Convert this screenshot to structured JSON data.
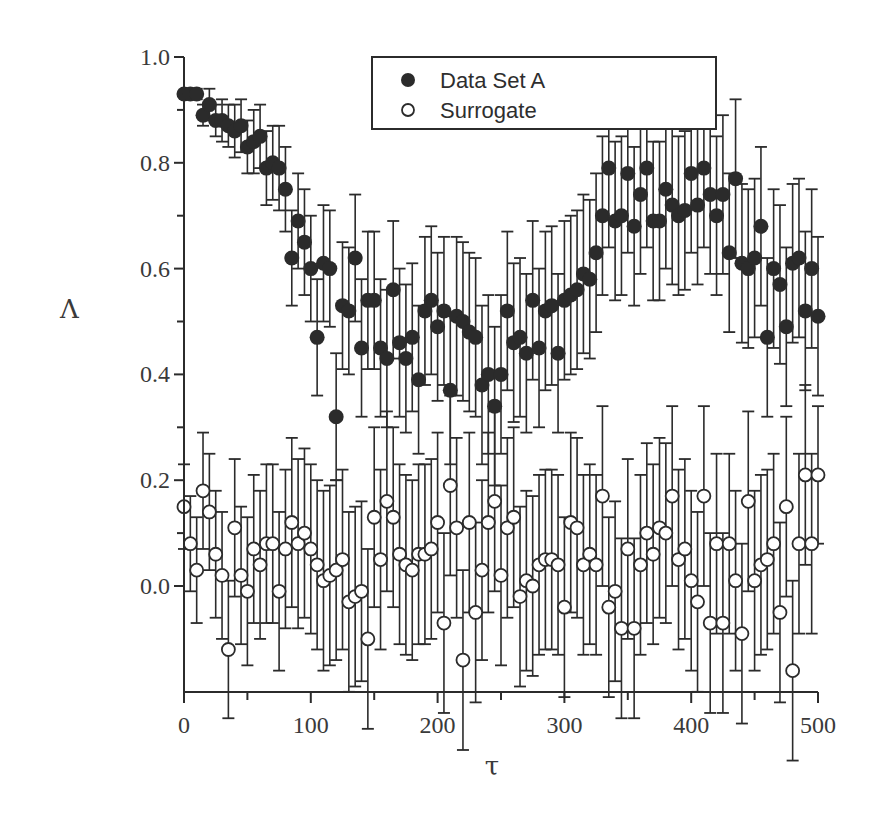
{
  "chart_data": {
    "type": "scatter",
    "title": "",
    "xlabel": "τ",
    "ylabel": "Λ",
    "xlim": [
      0,
      500
    ],
    "ylim": [
      -0.2,
      1.0
    ],
    "x_ticks": [
      0,
      100,
      200,
      300,
      400,
      500
    ],
    "x_tick_labels": [
      "0",
      "100",
      "200",
      "300",
      "400",
      "500"
    ],
    "y_ticks": [
      0.0,
      0.2,
      0.4,
      0.6,
      0.8,
      1.0
    ],
    "y_tick_labels": [
      "0.0",
      "0.2",
      "0.4",
      "0.6",
      "0.8",
      "1.0"
    ],
    "grid": false,
    "error_bars": true,
    "legend": {
      "position": "upper center",
      "entries": [
        "Data Set A",
        "Surrogate"
      ]
    },
    "x": [
      0,
      5,
      10,
      15,
      20,
      25,
      30,
      35,
      40,
      45,
      50,
      55,
      60,
      65,
      70,
      75,
      80,
      85,
      90,
      95,
      100,
      105,
      110,
      115,
      120,
      125,
      130,
      135,
      140,
      145,
      150,
      155,
      160,
      165,
      170,
      175,
      180,
      185,
      190,
      195,
      200,
      205,
      210,
      215,
      220,
      225,
      230,
      235,
      240,
      245,
      250,
      255,
      260,
      265,
      270,
      275,
      280,
      285,
      290,
      295,
      300,
      305,
      310,
      315,
      320,
      325,
      330,
      335,
      340,
      345,
      350,
      355,
      360,
      365,
      370,
      375,
      380,
      385,
      390,
      395,
      400,
      405,
      410,
      415,
      420,
      425,
      430,
      435,
      440,
      445,
      450,
      455,
      460,
      465,
      470,
      475,
      480,
      485,
      490,
      495,
      500
    ],
    "series": [
      {
        "name": "Data Set A",
        "marker": "filled-circle",
        "values": [
          0.93,
          0.93,
          0.93,
          0.89,
          0.91,
          0.88,
          0.88,
          0.87,
          0.86,
          0.87,
          0.83,
          0.84,
          0.85,
          0.79,
          0.8,
          0.79,
          0.75,
          0.62,
          0.69,
          0.65,
          0.6,
          0.47,
          0.61,
          0.6,
          0.32,
          0.53,
          0.52,
          0.62,
          0.45,
          0.54,
          0.54,
          0.45,
          0.43,
          0.56,
          0.46,
          0.43,
          0.47,
          0.39,
          0.52,
          0.54,
          0.49,
          0.52,
          0.37,
          0.51,
          0.5,
          0.48,
          0.47,
          0.38,
          0.4,
          0.34,
          0.4,
          0.52,
          0.46,
          0.47,
          0.44,
          0.54,
          0.45,
          0.52,
          0.53,
          0.44,
          0.54,
          0.55,
          0.56,
          0.59,
          0.58,
          0.63,
          0.7,
          0.79,
          0.69,
          0.7,
          0.78,
          0.68,
          0.74,
          0.79,
          0.69,
          0.69,
          0.75,
          0.72,
          0.7,
          0.71,
          0.78,
          0.72,
          0.79,
          0.74,
          0.7,
          0.74,
          0.63,
          0.77,
          0.61,
          0.6,
          0.62,
          0.68,
          0.47,
          0.6,
          0.57,
          0.49,
          0.61,
          0.62,
          0.52,
          0.6,
          0.51
        ],
        "errors": [
          0.0,
          0.0,
          0.01,
          0.02,
          0.03,
          0.03,
          0.04,
          0.04,
          0.05,
          0.05,
          0.05,
          0.06,
          0.06,
          0.07,
          0.07,
          0.08,
          0.08,
          0.09,
          0.09,
          0.1,
          0.1,
          0.11,
          0.11,
          0.11,
          0.12,
          0.12,
          0.12,
          0.12,
          0.13,
          0.13,
          0.13,
          0.13,
          0.13,
          0.13,
          0.14,
          0.14,
          0.14,
          0.14,
          0.14,
          0.14,
          0.14,
          0.14,
          0.14,
          0.15,
          0.15,
          0.15,
          0.15,
          0.15,
          0.15,
          0.15,
          0.15,
          0.15,
          0.15,
          0.15,
          0.15,
          0.15,
          0.15,
          0.15,
          0.15,
          0.15,
          0.15,
          0.15,
          0.15,
          0.15,
          0.15,
          0.15,
          0.15,
          0.15,
          0.15,
          0.15,
          0.15,
          0.15,
          0.15,
          0.15,
          0.15,
          0.15,
          0.15,
          0.15,
          0.15,
          0.15,
          0.15,
          0.15,
          0.15,
          0.15,
          0.15,
          0.15,
          0.15,
          0.15,
          0.15,
          0.15,
          0.15,
          0.15,
          0.15,
          0.15,
          0.15,
          0.15,
          0.15,
          0.15,
          0.15,
          0.15,
          0.15
        ]
      },
      {
        "name": "Surrogate",
        "marker": "open-circle",
        "values": [
          0.15,
          0.08,
          0.03,
          0.18,
          0.14,
          0.06,
          0.02,
          -0.12,
          0.11,
          0.02,
          -0.01,
          0.07,
          0.04,
          0.08,
          0.08,
          -0.01,
          0.07,
          0.12,
          0.08,
          0.1,
          0.07,
          0.04,
          0.01,
          0.02,
          0.03,
          0.05,
          -0.03,
          -0.02,
          -0.01,
          -0.1,
          0.13,
          0.05,
          0.16,
          0.13,
          0.06,
          0.04,
          0.03,
          0.06,
          0.06,
          0.07,
          0.12,
          -0.07,
          0.19,
          0.11,
          -0.14,
          0.12,
          -0.05,
          0.03,
          0.12,
          0.16,
          0.02,
          0.11,
          0.13,
          -0.02,
          0.01,
          0.0,
          0.04,
          0.05,
          0.05,
          0.04,
          -0.04,
          0.12,
          0.11,
          0.04,
          0.06,
          0.04,
          0.17,
          -0.04,
          -0.01,
          -0.08,
          0.07,
          -0.08,
          0.04,
          0.1,
          0.06,
          0.11,
          0.1,
          0.17,
          0.05,
          0.07,
          0.01,
          -0.03,
          0.17,
          -0.07,
          0.08,
          -0.07,
          0.08,
          0.01,
          -0.09,
          0.16,
          0.01,
          0.04,
          0.05,
          0.08,
          -0.05,
          0.15,
          -0.16,
          0.08,
          0.21,
          0.08,
          0.21
        ],
        "errors": [
          0.08,
          0.09,
          0.1,
          0.11,
          0.11,
          0.12,
          0.12,
          0.13,
          0.13,
          0.13,
          0.14,
          0.14,
          0.14,
          0.15,
          0.15,
          0.15,
          0.15,
          0.16,
          0.16,
          0.16,
          0.16,
          0.16,
          0.17,
          0.17,
          0.17,
          0.17,
          0.17,
          0.17,
          0.17,
          0.17,
          0.17,
          0.17,
          0.17,
          0.17,
          0.17,
          0.17,
          0.17,
          0.17,
          0.17,
          0.17,
          0.17,
          0.17,
          0.17,
          0.17,
          0.17,
          0.17,
          0.17,
          0.17,
          0.17,
          0.17,
          0.17,
          0.17,
          0.17,
          0.17,
          0.17,
          0.17,
          0.17,
          0.17,
          0.17,
          0.17,
          0.17,
          0.17,
          0.17,
          0.17,
          0.17,
          0.17,
          0.17,
          0.17,
          0.17,
          0.17,
          0.17,
          0.17,
          0.17,
          0.17,
          0.17,
          0.17,
          0.17,
          0.17,
          0.17,
          0.17,
          0.17,
          0.17,
          0.17,
          0.17,
          0.17,
          0.17,
          0.17,
          0.17,
          0.17,
          0.17,
          0.17,
          0.17,
          0.17,
          0.17,
          0.17,
          0.17,
          0.17,
          0.17,
          0.17,
          0.17,
          0.13
        ]
      }
    ]
  },
  "colors": {
    "ink": "#2b2b2b",
    "background": "#ffffff"
  }
}
